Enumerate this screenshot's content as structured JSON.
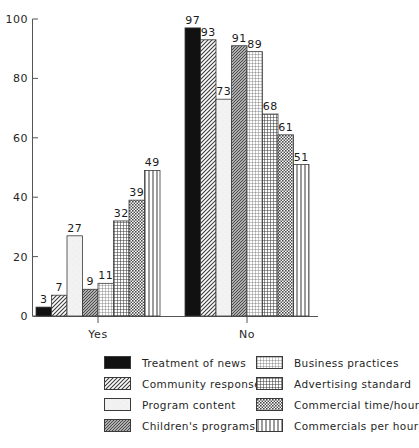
{
  "chart_data": {
    "type": "bar",
    "title": "",
    "subtitle": "",
    "xlabel": "",
    "ylabel": "",
    "categories": [
      "Yes",
      "No"
    ],
    "ylim": [
      0,
      100
    ],
    "yticks": [
      0,
      20,
      40,
      60,
      80,
      100
    ],
    "ytick_labels": [
      "0",
      "20",
      "40",
      "60",
      "80",
      "100"
    ],
    "grid": false,
    "legend_position": "bottom",
    "data_labels": true,
    "series": [
      {
        "name": "Treatment of news",
        "pattern": "solid-black",
        "values": [
          3,
          97
        ]
      },
      {
        "name": "Community response",
        "pattern": "diagonal-hatch",
        "values": [
          7,
          93
        ]
      },
      {
        "name": "Program content",
        "pattern": "light-blank",
        "values": [
          27,
          73
        ]
      },
      {
        "name": "Children's programs",
        "pattern": "dense-diagonal",
        "values": [
          9,
          91
        ]
      },
      {
        "name": "Business practices",
        "pattern": "fine-grid",
        "values": [
          11,
          89
        ]
      },
      {
        "name": "Advertising standard",
        "pattern": "heavy-grid",
        "values": [
          32,
          68
        ]
      },
      {
        "name": "Commercial time/hour",
        "pattern": "checker-dots",
        "values": [
          39,
          61
        ]
      },
      {
        "name": "Commercials per hour",
        "pattern": "vertical-lines",
        "values": [
          49,
          51
        ]
      }
    ]
  },
  "legend": {
    "columns": [
      {
        "items": [
          {
            "label": "Treatment of news",
            "pattern": "solid-black"
          },
          {
            "label": "Community response",
            "pattern": "diagonal-hatch"
          },
          {
            "label": "Program content",
            "pattern": "light-blank"
          },
          {
            "label": "Children's programs",
            "pattern": "dense-diagonal"
          }
        ]
      },
      {
        "items": [
          {
            "label": "Business practices",
            "pattern": "fine-grid"
          },
          {
            "label": "Advertising standard",
            "pattern": "heavy-grid"
          },
          {
            "label": "Commercial time/hour",
            "pattern": "checker-dots"
          },
          {
            "label": "Commercials per hour",
            "pattern": "vertical-lines"
          }
        ]
      }
    ]
  },
  "colors": {
    "axis": "#555555",
    "text": "#1a1a1a",
    "bar_outline": "#3a3a3a",
    "background": "#ffffff",
    "solid_fill": "#111111"
  }
}
